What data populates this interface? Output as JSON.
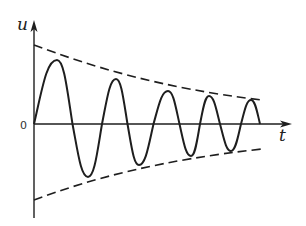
{
  "diagram": {
    "y_axis_label": "u",
    "x_axis_label": "t",
    "origin_label": "0",
    "colors": {
      "stroke": "#1e1e1e",
      "background": "#ffffff"
    },
    "curve": {
      "type": "damped-sinusoid",
      "start": [
        34,
        124
      ],
      "end": [
        260,
        124
      ],
      "peaks": [
        [
          57,
          60
        ],
        [
          116,
          79
        ],
        [
          168,
          91
        ],
        [
          209,
          96
        ],
        [
          251,
          100
        ]
      ],
      "troughs": [
        [
          88,
          177
        ],
        [
          139,
          165
        ],
        [
          191,
          156
        ],
        [
          231,
          151
        ]
      ]
    },
    "envelope": {
      "style": "dashed",
      "upper": {
        "start": [
          34,
          45
        ],
        "end": [
          262,
          100
        ]
      },
      "lower": {
        "start": [
          34,
          200
        ],
        "end": [
          262,
          149
        ]
      }
    }
  }
}
